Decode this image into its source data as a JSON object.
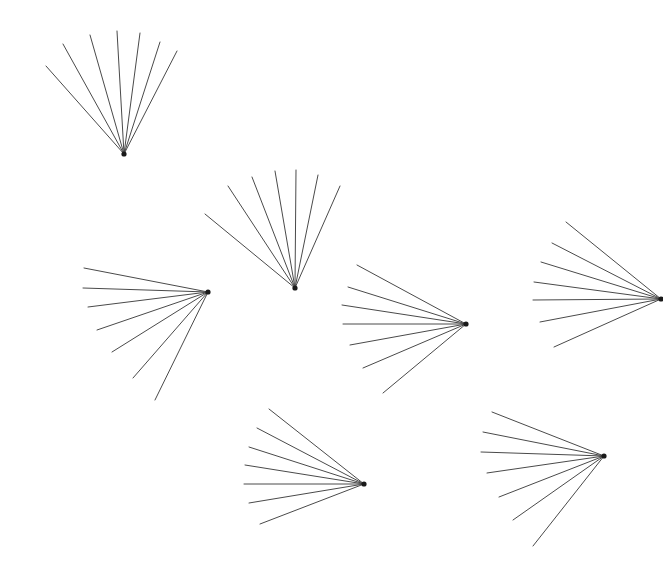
{
  "figure": {
    "background_color": "#ffffff",
    "line_color": "#4a4a4a",
    "apex_color": "#1a1a1a",
    "line_width": 1,
    "width": 663,
    "height": 588,
    "shape_count": 7,
    "rays_per_shape": 7
  },
  "chart_data": {
    "type": "scatter",
    "xlabel": "",
    "ylabel": "",
    "xlim": [
      0,
      663
    ],
    "ylim": [
      0,
      588
    ],
    "grid": false,
    "legend": "none",
    "shapes": [
      {
        "name": "fan-top-left",
        "apex": [
          124,
          154
        ],
        "orientation": "up",
        "rays": [
          {
            "tip": [
              46,
              66
            ],
            "length": 117
          },
          {
            "tip": [
              63,
              44
            ],
            "length": 135
          },
          {
            "tip": [
              90,
              35
            ],
            "length": 124
          },
          {
            "tip": [
              117,
              31
            ],
            "length": 123
          },
          {
            "tip": [
              140,
              33
            ],
            "length": 122
          },
          {
            "tip": [
              160,
              42
            ],
            "length": 115
          },
          {
            "tip": [
              177,
              51
            ],
            "length": 117
          }
        ]
      },
      {
        "name": "fan-upper-middle",
        "apex": [
          295,
          288
        ],
        "orientation": "up",
        "rays": [
          {
            "tip": [
              205,
              214
            ],
            "length": 117
          },
          {
            "tip": [
              228,
              186
            ],
            "length": 121
          },
          {
            "tip": [
              252,
              177
            ],
            "length": 118
          },
          {
            "tip": [
              275,
              171
            ],
            "length": 118
          },
          {
            "tip": [
              296,
              170
            ],
            "length": 118
          },
          {
            "tip": [
              318,
              175
            ],
            "length": 115
          },
          {
            "tip": [
              340,
              186
            ],
            "length": 111
          }
        ]
      },
      {
        "name": "fan-left-middle",
        "apex": [
          208,
          292
        ],
        "orientation": "left",
        "rays": [
          {
            "tip": [
              84,
              268
            ],
            "length": 126
          },
          {
            "tip": [
              83,
              288
            ],
            "length": 125
          },
          {
            "tip": [
              88,
              307
            ],
            "length": 123
          },
          {
            "tip": [
              97,
              330
            ],
            "length": 117
          },
          {
            "tip": [
              112,
              352
            ],
            "length": 114
          },
          {
            "tip": [
              133,
              378
            ],
            "length": 110
          },
          {
            "tip": [
              155,
              400
            ],
            "length": 120
          }
        ]
      },
      {
        "name": "fan-center",
        "apex": [
          466,
          324
        ],
        "orientation": "left",
        "rays": [
          {
            "tip": [
              357,
              265
            ],
            "length": 124
          },
          {
            "tip": [
              348,
              287
            ],
            "length": 122
          },
          {
            "tip": [
              342,
              305
            ],
            "length": 126
          },
          {
            "tip": [
              343,
              324
            ],
            "length": 123
          },
          {
            "tip": [
              350,
              345
            ],
            "length": 118
          },
          {
            "tip": [
              363,
              368
            ],
            "length": 110
          },
          {
            "tip": [
              383,
              393
            ],
            "length": 110
          }
        ]
      },
      {
        "name": "fan-right",
        "apex": [
          661,
          299
        ],
        "orientation": "left",
        "rays": [
          {
            "tip": [
              566,
              222
            ],
            "length": 122
          },
          {
            "tip": [
              552,
              243
            ],
            "length": 122
          },
          {
            "tip": [
              541,
              262
            ],
            "length": 125
          },
          {
            "tip": [
              534,
              282
            ],
            "length": 128
          },
          {
            "tip": [
              533,
              300
            ],
            "length": 128
          },
          {
            "tip": [
              540,
              322
            ],
            "length": 124
          },
          {
            "tip": [
              554,
              347
            ],
            "length": 118
          }
        ]
      },
      {
        "name": "fan-bottom-left",
        "apex": [
          364,
          484
        ],
        "orientation": "left",
        "rays": [
          {
            "tip": [
              269,
              409
            ],
            "length": 121
          },
          {
            "tip": [
              257,
              428
            ],
            "length": 120
          },
          {
            "tip": [
              249,
              447
            ],
            "length": 121
          },
          {
            "tip": [
              245,
              465
            ],
            "length": 121
          },
          {
            "tip": [
              244,
              484
            ],
            "length": 120
          },
          {
            "tip": [
              249,
              503
            ],
            "length": 117
          },
          {
            "tip": [
              260,
              524
            ],
            "length": 112
          }
        ]
      },
      {
        "name": "fan-bottom-right",
        "apex": [
          604,
          456
        ],
        "orientation": "left",
        "rays": [
          {
            "tip": [
              492,
              412
            ],
            "length": 120
          },
          {
            "tip": [
              483,
              432
            ],
            "length": 123
          },
          {
            "tip": [
              481,
              452
            ],
            "length": 123
          },
          {
            "tip": [
              487,
              473
            ],
            "length": 119
          },
          {
            "tip": [
              499,
              497
            ],
            "length": 113
          },
          {
            "tip": [
              513,
              520
            ],
            "length": 110
          },
          {
            "tip": [
              533,
              546
            ],
            "length": 114
          }
        ]
      }
    ]
  }
}
